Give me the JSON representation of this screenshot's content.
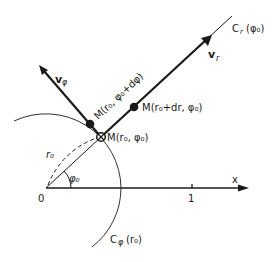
{
  "diagram": {
    "labels": {
      "origin": "0",
      "x_axis": "x",
      "tick_1": "1",
      "radius": "r₀",
      "angle": "φ₀",
      "point_M": "M(r₀, φ₀)",
      "point_M_dr": "M(r₀+dr, φ₀)",
      "point_M_dphi": "M(r₀, φ₀+dφ)",
      "vector_r": "v",
      "vector_r_sub": "r",
      "vector_phi": "v",
      "vector_phi_sub": "φ",
      "curve_r": "C",
      "curve_r_sub": "r",
      "curve_r_arg": "(φ₀)",
      "curve_phi": "C",
      "curve_phi_sub": "φ",
      "curve_phi_arg": "(r₀)"
    },
    "colors": {
      "ink": "#1a1a1a",
      "background": "#ffffff"
    }
  }
}
